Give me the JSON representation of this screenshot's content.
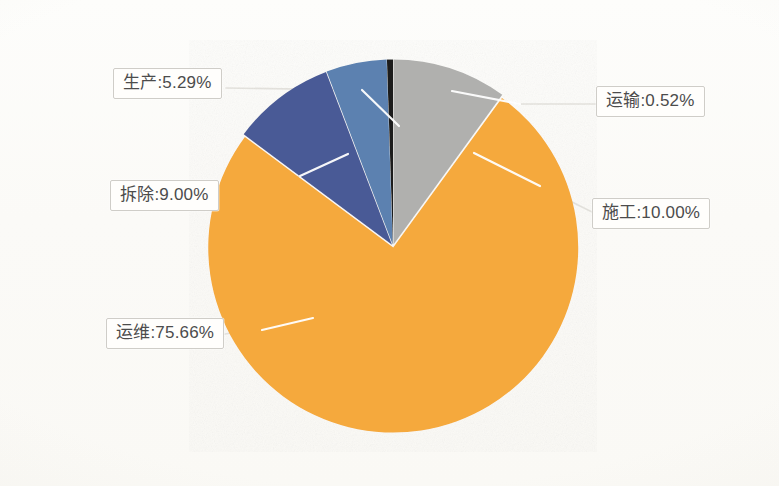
{
  "chart_data": {
    "type": "pie",
    "title": "",
    "subtitle": "",
    "xlabel": "",
    "ylabel": "",
    "legend_position": "none",
    "grid": false,
    "label_format": "name:percent",
    "categories": [
      "施工",
      "运输",
      "生产",
      "拆除",
      "运维"
    ],
    "values": [
      10.0,
      0.52,
      5.29,
      9.0,
      75.66
    ],
    "labels": [
      "施工:10.00%",
      "运输:0.52%",
      "生产:5.29%",
      "拆除:9.00%",
      "运维:75.66%"
    ],
    "colors": [
      "#b0b0ae",
      "#1c1c1c",
      "#5b81b0",
      "#4a5a96",
      "#f5a93c"
    ],
    "slices": [
      {
        "name": "施工",
        "value": 10.0,
        "label": "施工:10.00%",
        "color": "#b0b0ae",
        "start_angle": 0.0,
        "end_angle": 36.0
      },
      {
        "name": "运输",
        "value": 0.52,
        "label": "运输:0.52%",
        "color": "#1c1c1c",
        "start_angle": -1.872,
        "end_angle": 0.0
      },
      {
        "name": "生产",
        "value": 5.29,
        "label": "生产:5.29%",
        "color": "#5b81b0",
        "start_angle": -20.916,
        "end_angle": -1.872
      },
      {
        "name": "拆除",
        "value": 9.0,
        "label": "拆除:9.00%",
        "color": "#4a5a96",
        "start_angle": -53.316,
        "end_angle": -20.916
      },
      {
        "name": "运维",
        "value": 75.66,
        "label": "运维:75.66%",
        "color": "#f5a93c",
        "start_angle": 36.0,
        "end_angle": 306.684
      }
    ]
  },
  "labels": {
    "production": "生产:5.29%",
    "transport": "运输:0.52%",
    "demolition": "拆除:9.00%",
    "construction": "施工:10.00%",
    "operation": "运维:75.66%"
  },
  "style": {
    "background": "#fdfcfa",
    "label_border": "#cfcdc8",
    "label_text": "#4c4c4c",
    "leader_line": "#e8e6e1",
    "slice_gap": "#ffffff"
  }
}
